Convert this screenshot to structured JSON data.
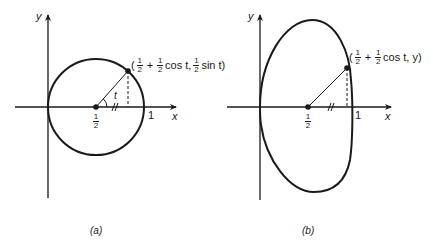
{
  "panels": [
    {
      "id": "a",
      "caption": "(a)",
      "axes": {
        "x_label": "x",
        "y_label": "y",
        "tick_one": "1",
        "tick_half_num": "1",
        "tick_half_den": "2"
      },
      "angle_label": "t",
      "point_label": {
        "open": "(",
        "frac1_num": "1",
        "frac1_den": "2",
        "plus": "+",
        "frac2_num": "1",
        "frac2_den": "2",
        "cos_part": "cos t,",
        "frac3_num": "1",
        "frac3_den": "2",
        "sin_part": "sin t)"
      },
      "curve": "circle centered (1/2, 0), radius 1/2"
    },
    {
      "id": "b",
      "caption": "(b)",
      "axes": {
        "x_label": "x",
        "y_label": "y",
        "tick_one": "1",
        "tick_half_num": "1",
        "tick_half_den": "2"
      },
      "point_label": {
        "open": "(",
        "frac1_num": "1",
        "frac1_den": "2",
        "plus": "+",
        "frac2_num": "1",
        "frac2_den": "2",
        "cos_part": "cos t, y)"
      },
      "curve": "closed oval curve through (0,0) and (1,0)"
    }
  ],
  "colors": {
    "ink": "#1a1a1a",
    "background": "#ffffff"
  }
}
